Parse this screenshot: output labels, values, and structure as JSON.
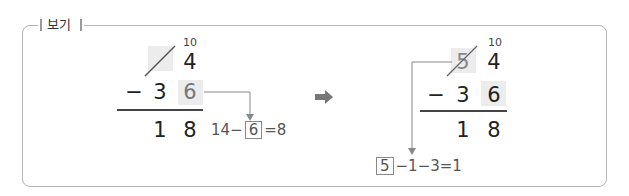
{
  "example": {
    "label": "보기",
    "left": {
      "borrow_mark": "10",
      "tens_top": "",
      "ones_top": "4",
      "operator": "−",
      "tens_sub": "3",
      "ones_sub": "6",
      "tens_result": "1",
      "ones_result": "8",
      "equation": {
        "prefix": "14−",
        "boxed": "6",
        "suffix": "=8"
      }
    },
    "arrow_icon": "right-arrow",
    "right": {
      "borrow_mark": "10",
      "tens_top": "5",
      "ones_top": "4",
      "operator": "−",
      "tens_sub": "3",
      "ones_sub": "6",
      "tens_result": "1",
      "ones_result": "8",
      "equation": {
        "boxed": "5",
        "suffix": "−1−3=1"
      }
    }
  },
  "colors": {
    "border": "#b5b5b5",
    "shade": "#ececec",
    "connector": "#888888",
    "arrow": "#777777"
  }
}
